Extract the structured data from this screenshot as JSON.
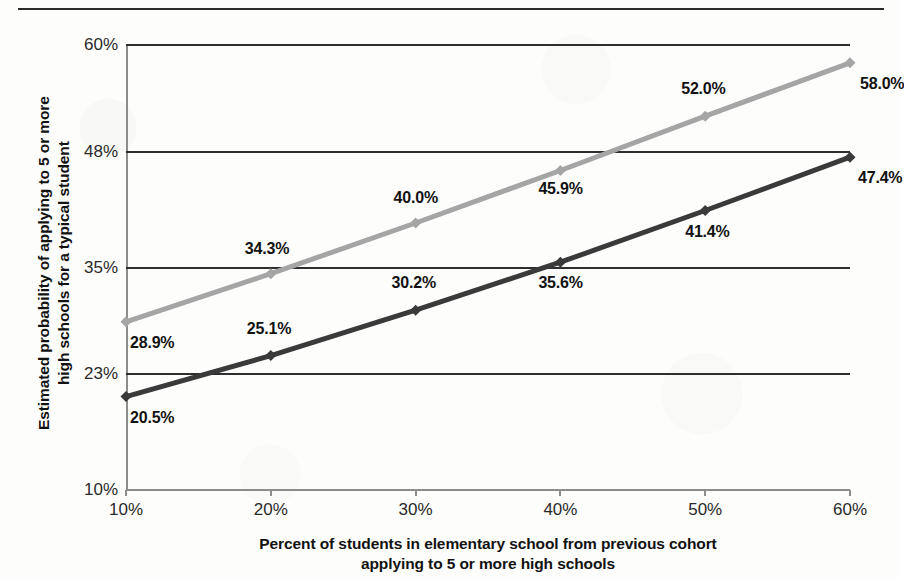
{
  "figure": {
    "has_top_rule": true,
    "background": "#fdfdfc"
  },
  "chart_data": {
    "type": "line",
    "title": "",
    "xlabel": "Percent of students in elementary school from previous cohort applying to 5 or more high schools",
    "ylabel": "Estimated probability of applying to 5 or more high schools for a typical student",
    "x": [
      10,
      20,
      30,
      40,
      50,
      60
    ],
    "xtick_labels": [
      "10%",
      "20%",
      "30%",
      "40%",
      "50%",
      "60%"
    ],
    "ytick_values": [
      10,
      23,
      35,
      48,
      60
    ],
    "ytick_labels": [
      "10%",
      "23%",
      "35%",
      "48%",
      "60%"
    ],
    "xlim": [
      10,
      60
    ],
    "ylim": [
      10,
      60
    ],
    "grid": "horizontal",
    "legend": "none",
    "series": [
      {
        "name": "upper-series",
        "color": "#a5a5a5",
        "marker": "diamond",
        "values": [
          28.9,
          34.3,
          40.0,
          45.9,
          52.0,
          58.0
        ],
        "data_labels": [
          "28.9%",
          "34.3%",
          "40.0%",
          "45.9%",
          "52.0%",
          "58.0%"
        ]
      },
      {
        "name": "lower-series",
        "color": "#3a3a3a",
        "marker": "diamond",
        "values": [
          20.5,
          25.1,
          30.2,
          35.6,
          41.4,
          47.4
        ],
        "data_labels": [
          "20.5%",
          "25.1%",
          "30.2%",
          "35.6%",
          "41.4%",
          "47.4%"
        ]
      }
    ]
  },
  "axis_titles": {
    "y_line1": "Estimated probability of applying to 5 or more",
    "y_line2": "high schools for a typical student",
    "x_line1": "Percent of students in elementary school from previous cohort",
    "x_line2": "applying to 5 or more high schools"
  }
}
